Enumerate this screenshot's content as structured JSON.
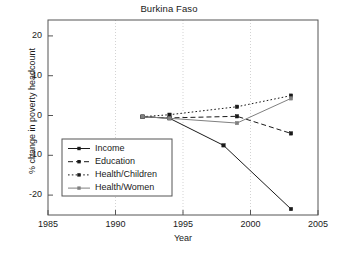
{
  "chart_data": {
    "type": "line",
    "title": "Burkina Faso",
    "xlabel": "Year",
    "ylabel": "% change in poverty headcount",
    "xlim": [
      1985,
      2005
    ],
    "ylim": [
      -25,
      24
    ],
    "xticks": [
      1985,
      1990,
      1995,
      2000,
      2005
    ],
    "yticks": [
      20,
      10,
      0,
      -10,
      -20
    ],
    "xtick_labels": [
      "1985",
      "1990",
      "1995",
      "2000",
      "2005"
    ],
    "ytick_labels": [
      "20",
      "10",
      "0",
      "-10",
      "-20"
    ],
    "grid": "vertical-dotted-at-xticks",
    "legend_position": "lower-left-inside",
    "series": [
      {
        "name": "Income",
        "style": "solid",
        "color": "#1a1a1a",
        "marker": "square",
        "x": [
          1992,
          1994,
          1998,
          2003
        ],
        "values": [
          -0.3,
          -0.7,
          -7.5,
          -23.5
        ]
      },
      {
        "name": "Education",
        "style": "dashed",
        "color": "#1a1a1a",
        "marker": "square",
        "x": [
          1992,
          1994,
          1999,
          2003
        ],
        "values": [
          -0.3,
          -0.6,
          -0.2,
          -4.5
        ]
      },
      {
        "name": "Health/Children",
        "style": "dotted",
        "color": "#1a1a1a",
        "marker": "square",
        "x": [
          1992,
          1994,
          1999,
          2003
        ],
        "values": [
          -0.3,
          0.2,
          2.2,
          5.0
        ]
      },
      {
        "name": "Health/Women",
        "style": "solid-gray",
        "color": "#808080",
        "marker": "square",
        "x": [
          1992,
          1994,
          1999,
          2003
        ],
        "values": [
          -0.3,
          -0.7,
          -1.9,
          4.3
        ]
      }
    ]
  },
  "legend": {
    "items": [
      {
        "label": "Income"
      },
      {
        "label": "Education"
      },
      {
        "label": "Health/Children"
      },
      {
        "label": "Health/Women"
      }
    ]
  }
}
